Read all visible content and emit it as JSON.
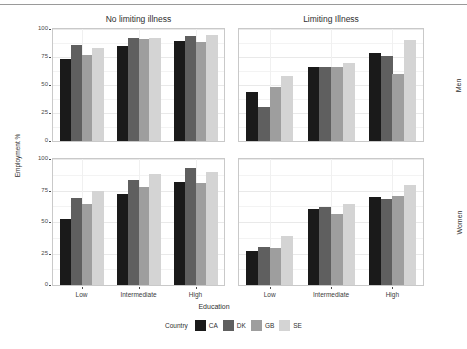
{
  "chart_data": {
    "type": "bar",
    "title": "",
    "xlabel": "Education",
    "ylabel": "Employment %",
    "ylim": [
      0,
      100
    ],
    "yticks": [
      0,
      25,
      50,
      75,
      100
    ],
    "ytick_labels": [
      "0",
      "25",
      "50",
      "75",
      "100"
    ],
    "categories": [
      "Low",
      "Intermediate",
      "High"
    ],
    "grid": true,
    "legend_position": "bottom",
    "legend_title": "Country",
    "series_names": [
      "CA",
      "DK",
      "GB",
      "SE"
    ],
    "series_colors": [
      "#1a1a1a",
      "#5f5f5f",
      "#9e9e9e",
      "#d4d4d4"
    ],
    "facet_col_labels": [
      "No limiting illness",
      "Limiting Illness"
    ],
    "facet_row_labels": [
      "Men",
      "Women"
    ],
    "panels": [
      {
        "row": "Men",
        "col": "No limiting illness",
        "series": [
          {
            "name": "CA",
            "values": [
              73,
              85,
              89
            ]
          },
          {
            "name": "DK",
            "values": [
              86,
              92,
              94
            ]
          },
          {
            "name": "GB",
            "values": [
              77,
              91,
              88
            ]
          },
          {
            "name": "SE",
            "values": [
              83,
              92,
              95
            ]
          }
        ]
      },
      {
        "row": "Men",
        "col": "Limiting Illness",
        "series": [
          {
            "name": "CA",
            "values": [
              44,
              66,
              79
            ]
          },
          {
            "name": "DK",
            "values": [
              30,
              66,
              76
            ]
          },
          {
            "name": "GB",
            "values": [
              48,
              66,
              60
            ]
          },
          {
            "name": "SE",
            "values": [
              58,
              70,
              90
            ]
          }
        ]
      },
      {
        "row": "Women",
        "col": "No limiting illness",
        "series": [
          {
            "name": "CA",
            "values": [
              52,
              72,
              82
            ]
          },
          {
            "name": "DK",
            "values": [
              69,
              83,
              93
            ]
          },
          {
            "name": "GB",
            "values": [
              64,
              78,
              81
            ]
          },
          {
            "name": "SE",
            "values": [
              75,
              88,
              90
            ]
          }
        ]
      },
      {
        "row": "Women",
        "col": "Limiting Illness",
        "series": [
          {
            "name": "CA",
            "values": [
              27,
              60,
              70
            ]
          },
          {
            "name": "DK",
            "values": [
              30,
              62,
              68
            ]
          },
          {
            "name": "GB",
            "values": [
              29,
              56,
              71
            ]
          },
          {
            "name": "SE",
            "values": [
              39,
              64,
              79
            ]
          }
        ]
      }
    ]
  },
  "legend": {
    "title": "Country",
    "items": [
      {
        "label": "CA",
        "color": "#1a1a1a"
      },
      {
        "label": "DK",
        "color": "#5f5f5f"
      },
      {
        "label": "GB",
        "color": "#9e9e9e"
      },
      {
        "label": "SE",
        "color": "#d4d4d4"
      }
    ]
  },
  "axes": {
    "ylabel": "Employment %",
    "xlabel": "Education"
  }
}
